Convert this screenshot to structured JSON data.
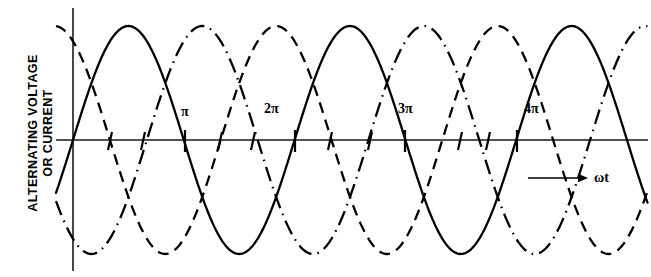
{
  "figure": {
    "y_axis_label": "ALTERNATING VOLTAGE\nOR CURRENT",
    "x_axis_label": "ωt",
    "tick_labels": [
      {
        "text": "π",
        "x": 181,
        "y": 104
      },
      {
        "text": "2π",
        "x": 264,
        "y": 101
      },
      {
        "text": "3π",
        "x": 398,
        "y": 101
      },
      {
        "text": "4π",
        "x": 524,
        "y": 101
      }
    ],
    "x_axis_label_pos": {
      "x": 594,
      "y": 170
    },
    "arrow": {
      "x1": 528,
      "y1": 178,
      "x2": 588,
      "y2": 178
    },
    "colors": {
      "line": "#000000",
      "axis": "#1a1a1a",
      "background": "#ffffff"
    }
  },
  "chart_data": {
    "type": "line",
    "title": "",
    "xlabel": "ωt",
    "ylabel": "ALTERNATING VOLTAGE OR CURRENT",
    "xlim": [
      0,
      5.28
    ],
    "ylim": [
      -1.08,
      1.08
    ],
    "grid": false,
    "legend": "none",
    "x_unit": "pi-radians",
    "x_tick_values": [
      1,
      2,
      3,
      4
    ],
    "x_tick_labels": [
      "π",
      "2π",
      "3π",
      "4π"
    ],
    "series": [
      {
        "name": "phase-a",
        "style": "solid",
        "phase_deg": 0,
        "amplitude": 1.0,
        "period_pi": 2,
        "zero_crossings_pi": [
          0,
          1,
          2,
          3,
          4,
          5
        ],
        "peaks_pi": [
          0.5,
          2.5,
          4.5
        ],
        "troughs_pi": [
          1.5,
          3.5
        ]
      },
      {
        "name": "phase-b",
        "style": "dashed",
        "phase_deg": 120,
        "amplitude": 1.0,
        "period_pi": 2,
        "zero_crossings_pi": [
          -0.667,
          0.333,
          1.333,
          2.333,
          3.333,
          4.333,
          5.333
        ],
        "peaks_pi": [
          -0.167,
          1.833,
          3.833
        ],
        "troughs_pi": [
          0.833,
          2.833,
          4.833
        ]
      },
      {
        "name": "phase-c",
        "style": "dash-dot",
        "phase_deg": 240,
        "amplitude": 1.0,
        "period_pi": 2,
        "zero_crossings_pi": [
          -0.333,
          0.667,
          1.667,
          2.667,
          3.667,
          4.667
        ],
        "peaks_pi": [
          0.167,
          2.167,
          4.167
        ],
        "troughs_pi": [
          1.167,
          3.167,
          5.167
        ]
      }
    ]
  }
}
